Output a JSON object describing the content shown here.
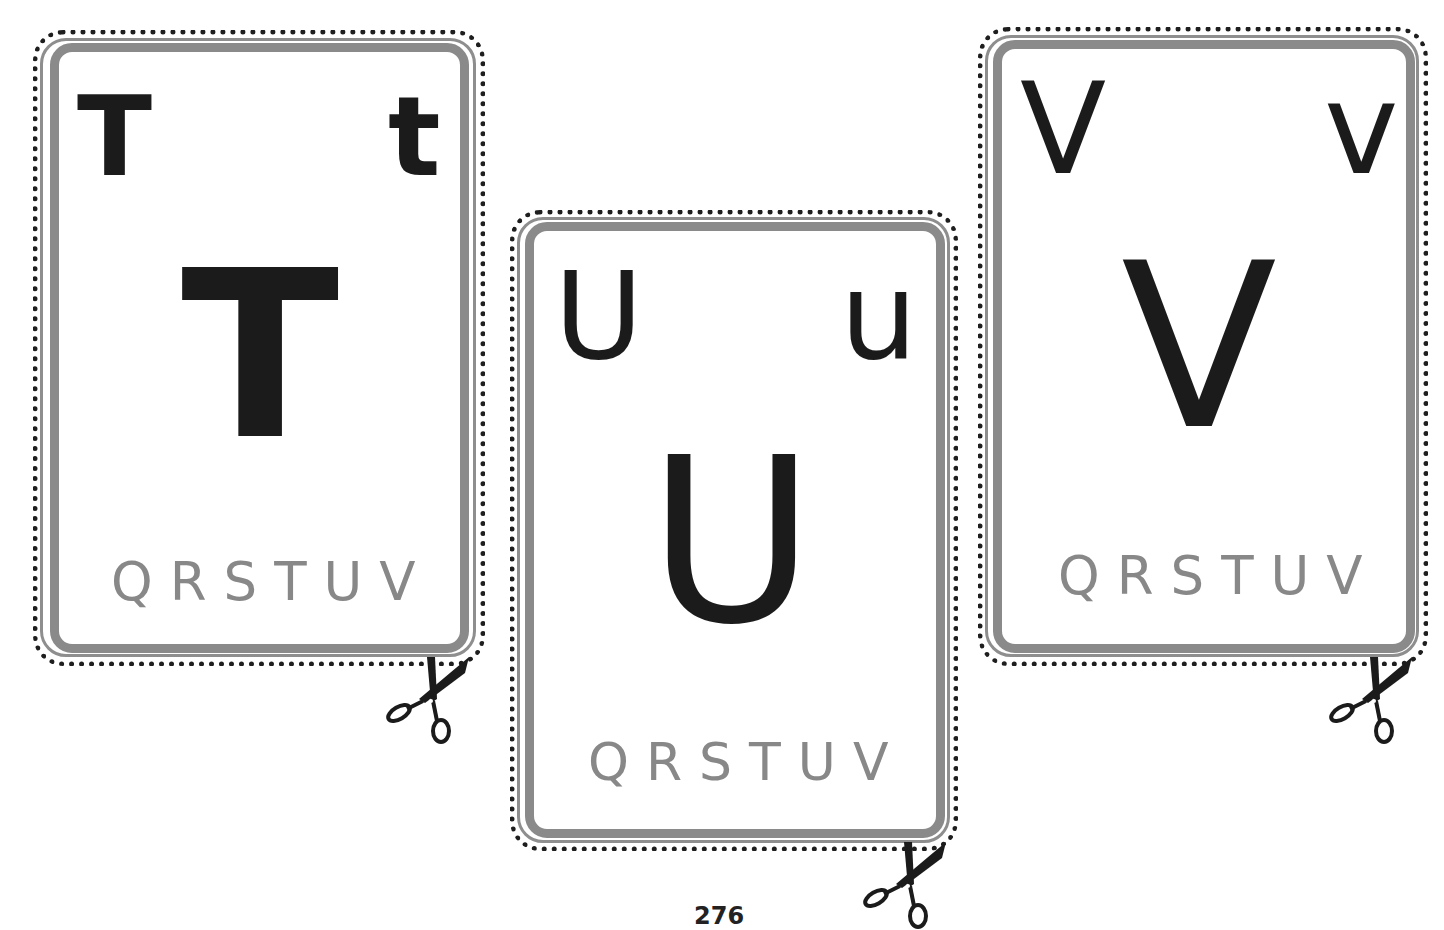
{
  "page": {
    "page_number": "276",
    "colors": {
      "letter": "#1b1b1b",
      "sequence_text": "#888888",
      "frame": "#8a8a8a",
      "cutline_dots": "#1e1e1e"
    }
  },
  "cards": [
    {
      "letter": "T",
      "upper_corner": "T",
      "lower_corner": "t",
      "big_letter": "T",
      "sequence": "QRSTUV",
      "cut_icon": "scissors-icon"
    },
    {
      "letter": "U",
      "upper_corner": "U",
      "lower_corner": "u",
      "big_letter": "U",
      "sequence": "QRSTUV",
      "cut_icon": "scissors-icon"
    },
    {
      "letter": "V",
      "upper_corner": "V",
      "lower_corner": "v",
      "big_letter": "V",
      "sequence": "QRSTUV",
      "cut_icon": "scissors-icon"
    }
  ]
}
